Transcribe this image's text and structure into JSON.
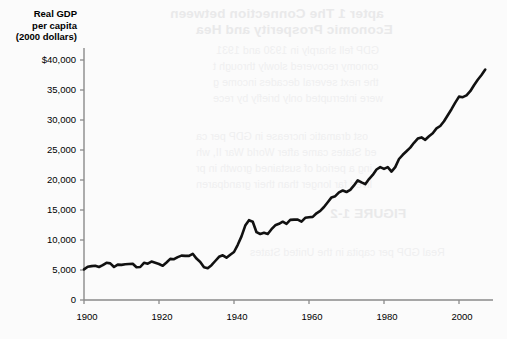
{
  "figure": {
    "background_color": "#fbfbfb",
    "line_color": "#111111",
    "axis_color": "#8a8a8a"
  },
  "bleed_through": {
    "note": "faint mirrored show-through text from the reverse side of the scanned page",
    "lines": [
      "apter 1   The Connection between",
      "Economic Prosperity and Hea",
      "GDP fell sharply in 1930 and 1931",
      "conomy recovered slowly through t",
      "the next several decades income g",
      "were interrupted only briefly by rece",
      "ost dramatic increase in GDP per ca",
      "ed States came after World War II, wh",
      "ing a period of sustained growth in pr",
      "lived far longer than their grandparen",
      "FIGURE 1-2",
      "Real GDP per capita in the United States"
    ]
  },
  "chart_data": {
    "type": "line",
    "title": "",
    "xlabel": "",
    "ylabel": "Real GDP per capita (2000 dollars)",
    "ylabel_lines": [
      "Real GDP",
      "per capita",
      "(2000 dollars)"
    ],
    "xlim": [
      1900,
      2008
    ],
    "ylim": [
      0,
      41500
    ],
    "grid": false,
    "legend": null,
    "y_ticks": [
      0,
      5000,
      10000,
      15000,
      20000,
      25000,
      30000,
      35000,
      40000
    ],
    "y_tick_labels": [
      "0",
      "5,000",
      "10,000",
      "15,000",
      "20,000",
      "25,000",
      "30,000",
      "35,000",
      "$40,000"
    ],
    "x_ticks": [
      1900,
      1920,
      1940,
      1960,
      1980,
      2000
    ],
    "x_tick_labels": [
      "1900",
      "1920",
      "1940",
      "1960",
      "1980",
      "2000"
    ],
    "series": [
      {
        "name": "Real GDP per capita (2000 dollars)",
        "x": [
          1900,
          1901,
          1902,
          1903,
          1904,
          1905,
          1906,
          1907,
          1908,
          1909,
          1910,
          1911,
          1912,
          1913,
          1914,
          1915,
          1916,
          1917,
          1918,
          1919,
          1920,
          1921,
          1922,
          1923,
          1924,
          1925,
          1926,
          1927,
          1928,
          1929,
          1930,
          1931,
          1932,
          1933,
          1934,
          1935,
          1936,
          1937,
          1938,
          1939,
          1940,
          1941,
          1942,
          1943,
          1944,
          1945,
          1946,
          1947,
          1948,
          1949,
          1950,
          1951,
          1952,
          1953,
          1954,
          1955,
          1956,
          1957,
          1958,
          1959,
          1960,
          1961,
          1962,
          1963,
          1964,
          1965,
          1966,
          1967,
          1968,
          1969,
          1970,
          1971,
          1972,
          1973,
          1974,
          1975,
          1976,
          1977,
          1978,
          1979,
          1980,
          1981,
          1982,
          1983,
          1984,
          1985,
          1986,
          1987,
          1988,
          1989,
          1990,
          1991,
          1992,
          1993,
          1994,
          1995,
          1996,
          1997,
          1998,
          1999,
          2000,
          2001,
          2002,
          2003,
          2004,
          2005,
          2006,
          2007
        ],
        "values": [
          5100,
          5550,
          5650,
          5700,
          5500,
          5800,
          6200,
          6100,
          5500,
          5900,
          5850,
          5950,
          6000,
          6050,
          5450,
          5500,
          6200,
          6050,
          6400,
          6200,
          6000,
          5700,
          6250,
          6850,
          6800,
          7150,
          7400,
          7350,
          7350,
          7700,
          6900,
          6350,
          5450,
          5300,
          5800,
          6500,
          7200,
          7450,
          7050,
          7550,
          8000,
          9200,
          10600,
          12400,
          13300,
          13050,
          11300,
          11000,
          11200,
          11000,
          11800,
          12450,
          12700,
          13050,
          12700,
          13350,
          13400,
          13400,
          13050,
          13700,
          13800,
          13850,
          14450,
          14850,
          15500,
          16300,
          17100,
          17300,
          17950,
          18250,
          18000,
          18350,
          19100,
          19950,
          19600,
          19300,
          20150,
          20850,
          21750,
          22150,
          21850,
          22150,
          21400,
          22150,
          23500,
          24200,
          24800,
          25400,
          26200,
          26900,
          27100,
          26700,
          27300,
          27800,
          28600,
          29000,
          29800,
          30800,
          31800,
          32900,
          33900,
          33800,
          34100,
          34800,
          35800,
          36700,
          37500,
          38400
        ]
      }
    ]
  }
}
